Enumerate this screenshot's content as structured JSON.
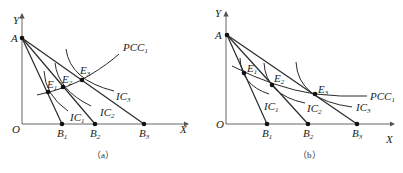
{
  "panels": [
    {
      "id": "a",
      "caption": "（a）",
      "axes": {
        "y_label": "Y",
        "x_label": "X",
        "origin_label": "O"
      },
      "points": {
        "A": "A",
        "B1": {
          "base": "B",
          "sub": "1"
        },
        "B2": {
          "base": "B",
          "sub": "2"
        },
        "B3": {
          "base": "B",
          "sub": "3"
        },
        "E1": {
          "base": "E",
          "sub": "1"
        },
        "E2": {
          "base": "E",
          "sub": "2"
        },
        "E3": {
          "base": "E",
          "sub": "3"
        }
      },
      "curves": {
        "IC1": {
          "base": "IC",
          "sub": "1"
        },
        "IC2": {
          "base": "IC",
          "sub": "2"
        },
        "IC3": {
          "base": "IC",
          "sub": "3"
        },
        "PCC": {
          "base": "PCC",
          "sub": "1"
        }
      },
      "description": "PCC slopes upward"
    },
    {
      "id": "b",
      "caption": "（b）",
      "axes": {
        "y_label": "Y",
        "x_label": "X",
        "origin_label": "O"
      },
      "points": {
        "A": "A",
        "B1": {
          "base": "B",
          "sub": "1"
        },
        "B2": {
          "base": "B",
          "sub": "2"
        },
        "B3": {
          "base": "B",
          "sub": "3"
        },
        "E1": {
          "base": "E",
          "sub": "1"
        },
        "E2": {
          "base": "E",
          "sub": "2"
        },
        "E3": {
          "base": "E",
          "sub": "3"
        }
      },
      "curves": {
        "IC1": {
          "base": "IC",
          "sub": "1"
        },
        "IC2": {
          "base": "IC",
          "sub": "2"
        },
        "IC3": {
          "base": "IC",
          "sub": "3"
        },
        "PCC": {
          "base": "PCC",
          "sub": "1"
        }
      },
      "description": "PCC slopes downward"
    }
  ]
}
